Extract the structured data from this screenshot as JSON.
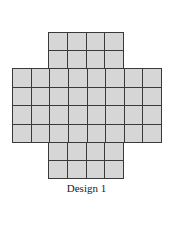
{
  "figure": {
    "caption": "Design 1",
    "cell_color": "#d6d6d6",
    "line_color": "#3a3a3a",
    "blocks": [
      {
        "name": "top-block",
        "cols": 4,
        "rows": 2,
        "x": 48,
        "y": 32,
        "w": 76,
        "h": 37
      },
      {
        "name": "middle-block",
        "cols": 8,
        "rows": 4,
        "x": 12,
        "y": 68,
        "w": 150,
        "h": 75
      },
      {
        "name": "bottom-block",
        "cols": 4,
        "rows": 2,
        "x": 48,
        "y": 142,
        "w": 76,
        "h": 37
      }
    ]
  }
}
